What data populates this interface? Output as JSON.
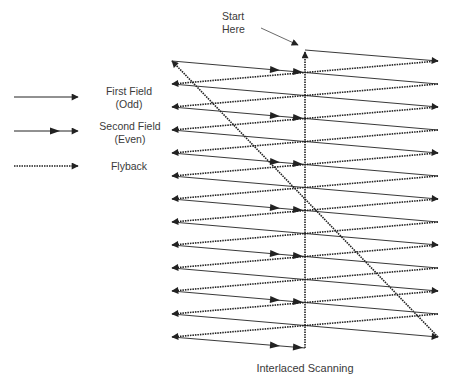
{
  "title": "Interlaced Scanning",
  "start_label": [
    "Start",
    "Here"
  ],
  "legend": [
    {
      "label_lines": [
        "First Field",
        "(Odd)"
      ],
      "style": "solid-single-arrow"
    },
    {
      "label_lines": [
        "Second Field",
        "(Even)"
      ],
      "style": "solid-double-arrow"
    },
    {
      "label_lines": [
        "Flyback"
      ],
      "style": "dotted-arrow"
    }
  ],
  "geometry": {
    "left_x": 172,
    "right_x": 438,
    "center_x": 305,
    "top_y": 61,
    "step_y": 23,
    "levels": 13,
    "start_y": 50,
    "end_y": 348
  },
  "colors": {
    "line": "#222222",
    "text": "#3a3a3a",
    "background": "#ffffff"
  }
}
